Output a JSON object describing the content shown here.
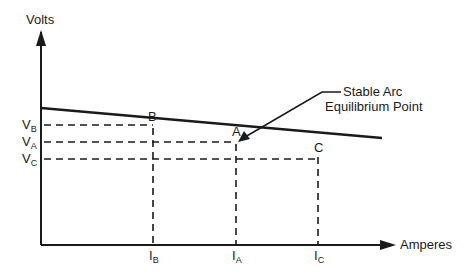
{
  "diagram": {
    "y_axis_label": "Volts",
    "x_axis_label": "Amperes",
    "annotation": {
      "line1": "Stable Arc",
      "line2": "Equilibrium Point"
    },
    "points": [
      {
        "name": "B",
        "v_label": "V",
        "v_sub": "B",
        "i_label": "I",
        "i_sub": "B"
      },
      {
        "name": "A",
        "v_label": "V",
        "v_sub": "A",
        "i_label": "I",
        "i_sub": "A"
      },
      {
        "name": "C",
        "v_label": "V",
        "v_sub": "C",
        "i_label": "I",
        "i_sub": "C"
      }
    ],
    "colors": {
      "line": "#1a1a1a",
      "background": "#ffffff"
    }
  }
}
